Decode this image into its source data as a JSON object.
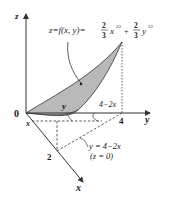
{
  "figure": {
    "surface_label": "z = f(x, y) = (2/3) x^(3/2) + (2/3) y^(3/2)",
    "formula": {
      "lhs": "z=f(x, y)=",
      "coef1_num": "2",
      "coef1_den": "3",
      "var1": "x",
      "exp1": "3/2",
      "plus": "+",
      "coef2_num": "2",
      "coef2_den": "3",
      "var2": "y",
      "exp2": "3/2"
    },
    "axes": {
      "z_label": "z",
      "y_label": "y",
      "x_label": "x",
      "origin_label": "0"
    },
    "ticks": {
      "y_tick": "4",
      "x_tick": "2"
    },
    "annotations": {
      "x_near_origin": "x",
      "y_on_surface": "y",
      "strip_height": "4−2x",
      "line_equation": "y = 4−2x",
      "plane_note": "(z = 0)"
    },
    "colors": {
      "surface_fill": "#b9b9b9",
      "lines": "#333333"
    }
  }
}
